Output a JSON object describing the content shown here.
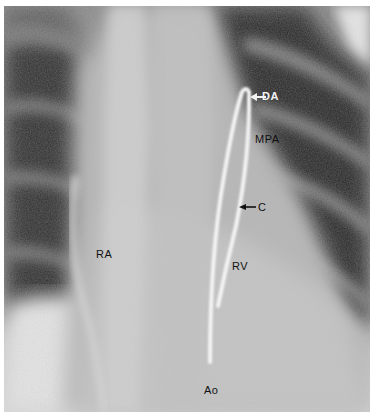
{
  "image": {
    "description": "Chest radiograph (AP) showing a catheter passed through the right ventricle and main pulmonary artery into the ductus arteriosus",
    "colors": {
      "background": "#ffffff",
      "lung_dark": "#2a2a2a",
      "mediastinum": "#b8b8b8",
      "catheter": "#f4f4f4"
    }
  },
  "labels": {
    "da": "DA",
    "mpa": "MPA",
    "c": "C",
    "ra": "RA",
    "rv": "RV",
    "ao": "Ao"
  },
  "arrows": {
    "da_arrow": "white arrow pointing left to catheter tip",
    "c_arrow": "black arrow pointing left to catheter"
  }
}
